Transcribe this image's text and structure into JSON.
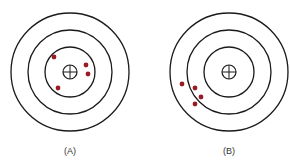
{
  "diagram": {
    "ring_color": "#1a1a1a",
    "dot_color": "#9b1b24",
    "targets": [
      {
        "id": "A",
        "label": "(A)",
        "center": [
          70,
          72
        ],
        "ring_radii": [
          59,
          42,
          25
        ],
        "crosshair_radius": 7,
        "label_pos": [
          70,
          146
        ],
        "shots": [
          [
            54,
            57
          ],
          [
            86,
            65
          ],
          [
            88,
            74
          ],
          [
            58,
            88
          ]
        ]
      },
      {
        "id": "B",
        "label": "(B)",
        "center": [
          229,
          72
        ],
        "ring_radii": [
          59,
          42,
          25
        ],
        "crosshair_radius": 7,
        "label_pos": [
          229,
          146
        ],
        "shots": [
          [
            182,
            84
          ],
          [
            195,
            88
          ],
          [
            201,
            97
          ],
          [
            195,
            104
          ]
        ]
      }
    ]
  }
}
